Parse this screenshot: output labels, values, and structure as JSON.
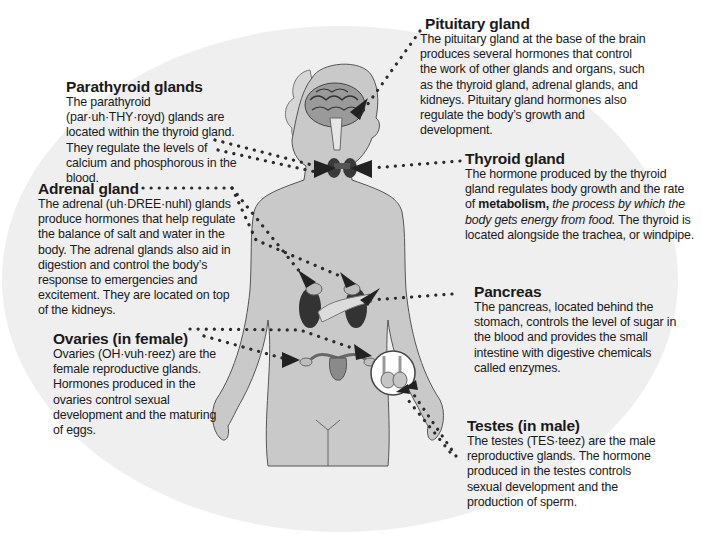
{
  "diagram": {
    "colors": {
      "background": "#ffffff",
      "ellipse": "#efefef",
      "body": "#c9c9c9",
      "outline": "#555555",
      "dots": "#2b2b2b",
      "organ_dark": "#3a3a3a",
      "text": "#1a1a1a"
    },
    "labels": {
      "pituitary": {
        "title": "Pituitary gland",
        "text": "The pituitary gland at the base of the brain produces several hormones that control the work of other glands and organs, such as the thyroid gland, adrenal glands, and kidneys. Pituitary gland hormones also regulate the body’s growth and development."
      },
      "parathyroid": {
        "title": "Parathyroid glands",
        "text": "The parathyroid (par·uh·THY·royd) glands are located within the thyroid gland. They regulate the levels of calcium and phosphorous in the blood."
      },
      "thyroid": {
        "title": "Thyroid gland",
        "text_pre": "The hormone produced by the thyroid gland regulates body growth and the rate of ",
        "term": "metabolism,",
        "definition": " the process by which the body gets energy from food.",
        "text_post": " The thyroid is located alongside the trachea, or windpipe."
      },
      "adrenal": {
        "title": "Adrenal gland",
        "text": "The adrenal (uh·DREE·nuhl) glands produce hormones that help regulate the balance of salt and water in the body. The adrenal glands also aid in digestion and control the body’s response to emergencies and excitement. They are located on top of the kidneys."
      },
      "pancreas": {
        "title": "Pancreas",
        "text": "The pancreas, located behind the stomach, controls the level of sugar in the blood and provides the small intestine with digestive chemicals called enzymes."
      },
      "ovaries": {
        "title": "Ovaries (in female)",
        "text": "Ovaries (OH·vuh·reez) are the female reproductive glands. Hormones produced in the ovaries control sexual development and the maturing of eggs."
      },
      "testes": {
        "title": "Testes (in male)",
        "text": "The testes (TES·teez) are the male reproductive glands. The hormone produced in the testes controls sexual development and the production of sperm."
      }
    }
  }
}
